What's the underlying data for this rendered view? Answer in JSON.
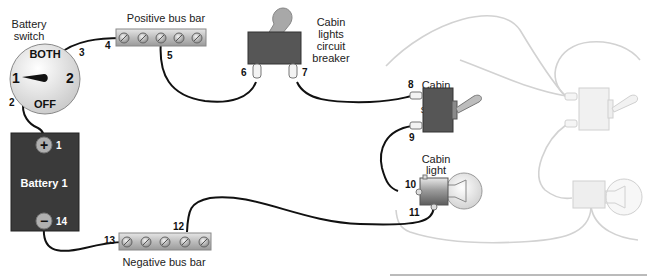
{
  "diagram": {
    "components": {
      "battery_switch": {
        "label_line1": "Battery",
        "label_line2": "switch",
        "positions": {
          "both": "BOTH",
          "one": "1",
          "two": "2",
          "off": "OFF"
        }
      },
      "battery": {
        "label": "Battery 1",
        "positive_symbol": "+",
        "negative_symbol": "−"
      },
      "positive_bus_bar": {
        "label": "Positive bus bar"
      },
      "negative_bus_bar": {
        "label": "Negative bus bar"
      },
      "circuit_breaker": {
        "label_lines": [
          "Cabin",
          "lights",
          "circuit",
          "breaker"
        ]
      },
      "light_switch": {
        "label_lines": [
          "Cabin",
          "light",
          "switch"
        ]
      },
      "cabin_light": {
        "label_lines": [
          "Cabin",
          "light"
        ]
      }
    },
    "terminals": {
      "t1": "1",
      "t2": "2",
      "t3": "3",
      "t4": "4",
      "t5": "5",
      "t6": "6",
      "t7": "7",
      "t8": "8",
      "t9": "9",
      "t10": "10",
      "t11": "11",
      "t12": "12",
      "t13": "13",
      "t14": "14"
    },
    "colors": {
      "wire": "#111111",
      "ghost_wire": "#d2d2d2",
      "battery_body": "#3a3a3a",
      "breaker_body": "#555555",
      "switch_body": "#555555",
      "bus_bar": "#c8c8c8"
    }
  }
}
